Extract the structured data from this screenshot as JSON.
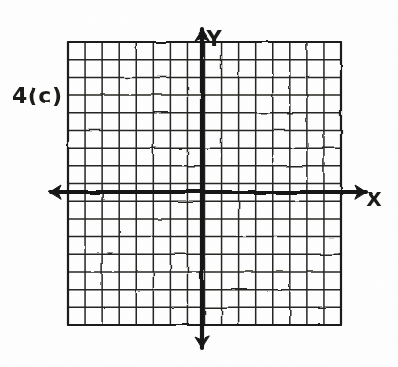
{
  "figure": {
    "kind": "hand-drawn-graph-paper",
    "medium": "black pen on white paper",
    "paper_color": "#ffffff",
    "ink_color": "#1a1a18",
    "width": 398,
    "height": 367,
    "question_label": "4(c)",
    "has_plotted_curve": false,
    "notes_visible_text": [
      "4(c)",
      "Y",
      "X"
    ]
  },
  "axes": {
    "x_axis": {
      "label": "X",
      "label_x": 374,
      "label_y": 206,
      "line_y": 192,
      "line_x_start": 50,
      "line_x_end": 366,
      "arrow_left": true,
      "arrow_right": true,
      "stroke_width": 4.2
    },
    "y_axis": {
      "label": "Y",
      "label_x": 214,
      "label_y": 46,
      "line_x": 202,
      "line_y_start": 30,
      "line_y_end": 348,
      "arrow_up": true,
      "arrow_down": true,
      "stroke_width": 4.2
    },
    "origin": {
      "x": 202,
      "y": 192
    }
  },
  "grid": {
    "left": 68,
    "top": 42,
    "right": 341,
    "bottom": 325,
    "columns": 16,
    "rows": 16,
    "cell_width": 17.06,
    "cell_height": 17.69,
    "stroke_width": 1.5,
    "stroke_color": "#262624",
    "border_stroke_width": 2.2
  },
  "chart_data": {
    "type": "scatter",
    "title": "4(c)",
    "xlabel": "X",
    "ylabel": "Y",
    "grid": true,
    "legend": "none",
    "series": [],
    "x": [],
    "values": [],
    "xlim": [
      -7.86,
      8.14
    ],
    "ylim": [
      -7.52,
      8.48
    ],
    "xticks": [],
    "yticks": [],
    "annotations": [
      "4(c)"
    ]
  }
}
